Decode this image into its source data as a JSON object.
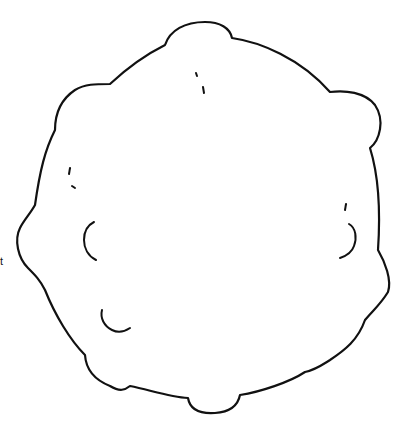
{
  "canvas": {
    "width": 405,
    "height": 429,
    "background": "#ffffff"
  },
  "drawing": {
    "subject": "lumpy-round-blob-outline",
    "stroke_color": "#111111",
    "style": "black line art on white"
  },
  "edge_text": "t"
}
